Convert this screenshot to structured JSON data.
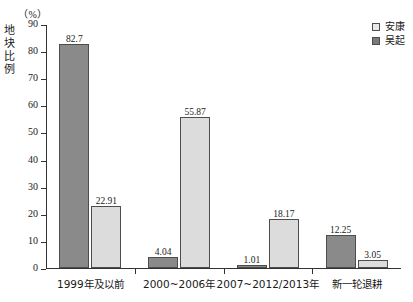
{
  "chart_data": {
    "type": "bar",
    "title": "",
    "subtitle": "",
    "xlabel": "",
    "ylabel": "地块比例",
    "unit_label": "（%）",
    "ylim": [
      0,
      90
    ],
    "yticks": [
      0,
      10,
      20,
      30,
      40,
      50,
      60,
      70,
      80,
      90
    ],
    "grid": false,
    "legend_position": "top-right",
    "categories": [
      "1999年及以前",
      "2000~2006年",
      "2007~2012/2013年",
      "新一轮退耕"
    ],
    "series": [
      {
        "name": "吴起",
        "color": "#8a8a8a",
        "values": [
          82.7,
          4.04,
          1.01,
          12.25
        ],
        "labels": [
          "82.7",
          "4.04",
          "1.01",
          "12.25"
        ]
      },
      {
        "name": "安康",
        "color": "#dcdcdc",
        "values": [
          22.91,
          55.87,
          18.17,
          3.05
        ],
        "labels": [
          "22.91",
          "55.87",
          "18.17",
          "3.05"
        ]
      }
    ]
  },
  "legend": {
    "items": [
      {
        "label": "安康",
        "series": "ankang"
      },
      {
        "label": "吴起",
        "series": "wuqi"
      }
    ]
  },
  "axis": {
    "y_title_chars": [
      "地",
      "块",
      "比",
      "例"
    ],
    "tick_labels": [
      "90",
      "80",
      "70",
      "60",
      "50",
      "40",
      "30",
      "20",
      "10",
      "0"
    ]
  }
}
